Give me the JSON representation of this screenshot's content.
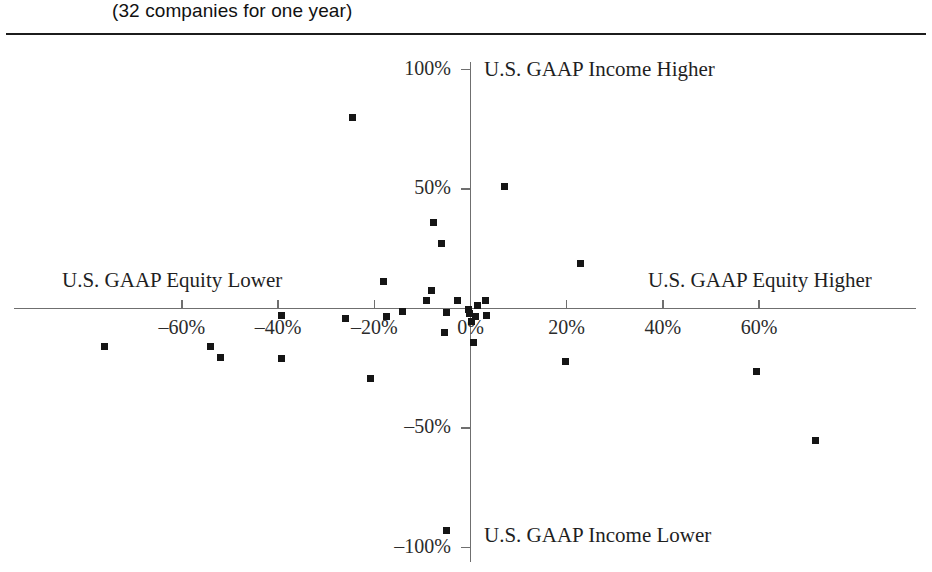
{
  "header": {
    "subtitle": "(32 companies for one year)"
  },
  "chart_data": {
    "type": "scatter",
    "title": "(32 companies for one year)",
    "xlabel": "",
    "ylabel": "",
    "xlim": [
      -60,
      60
    ],
    "ylim": [
      -100,
      100
    ],
    "grid": false,
    "legend": null,
    "x_ticks": [
      {
        "value": -60,
        "label": "–60%"
      },
      {
        "value": -40,
        "label": "–40%"
      },
      {
        "value": -20,
        "label": "–20%"
      },
      {
        "value": 0,
        "label": "0%"
      },
      {
        "value": 20,
        "label": "20%"
      },
      {
        "value": 40,
        "label": "40%"
      },
      {
        "value": 60,
        "label": "60%"
      }
    ],
    "y_ticks": [
      {
        "value": 100,
        "label": "100%"
      },
      {
        "value": 50,
        "label": "50%"
      },
      {
        "value": -50,
        "label": "–50%"
      },
      {
        "value": -100,
        "label": "–100%"
      }
    ],
    "annotations": [
      {
        "name": "income-higher",
        "text": "U.S. GAAP Income Higher",
        "position": "top-right-of-y-axis"
      },
      {
        "name": "income-lower",
        "text": "U.S. GAAP Income Lower",
        "position": "bottom-right-of-y-axis"
      },
      {
        "name": "equity-lower",
        "text": "U.S. GAAP Equity Lower",
        "position": "left-above-x-axis"
      },
      {
        "name": "equity-higher",
        "text": "U.S. GAAP Equity Higher",
        "position": "right-above-x-axis"
      }
    ],
    "points": [
      {
        "x": -24.6,
        "y": 80.0
      },
      {
        "x": 7.1,
        "y": 51.2
      },
      {
        "x": -7.7,
        "y": 35.8
      },
      {
        "x": -6.0,
        "y": 27.1
      },
      {
        "x": 22.9,
        "y": 18.8
      },
      {
        "x": -8.1,
        "y": 7.5
      },
      {
        "x": -18.1,
        "y": 11.2
      },
      {
        "x": -9.2,
        "y": 3.3
      },
      {
        "x": -2.7,
        "y": 3.3
      },
      {
        "x": 3.1,
        "y": 3.3
      },
      {
        "x": -14.2,
        "y": -1.2
      },
      {
        "x": -5.0,
        "y": -1.7
      },
      {
        "x": -0.4,
        "y": -0.4
      },
      {
        "x": -0.2,
        "y": -2.1
      },
      {
        "x": 1.0,
        "y": -3.3
      },
      {
        "x": 3.3,
        "y": -2.9
      },
      {
        "x": -17.5,
        "y": -3.3
      },
      {
        "x": -26.0,
        "y": -4.2
      },
      {
        "x": -5.4,
        "y": -10.0
      },
      {
        "x": 0.6,
        "y": -14.2
      },
      {
        "x": -39.2,
        "y": -2.9
      },
      {
        "x": -54.0,
        "y": -15.8
      },
      {
        "x": -76.0,
        "y": -15.8
      },
      {
        "x": -52.0,
        "y": -20.4
      },
      {
        "x": -39.2,
        "y": -20.8
      },
      {
        "x": -20.8,
        "y": -29.2
      },
      {
        "x": 19.8,
        "y": -22.1
      },
      {
        "x": 59.4,
        "y": -26.2
      },
      {
        "x": 71.7,
        "y": -55.4
      },
      {
        "x": -5.0,
        "y": -92.9
      },
      {
        "x": 1.5,
        "y": 1.2
      },
      {
        "x": 0.2,
        "y": -5.4
      }
    ]
  }
}
